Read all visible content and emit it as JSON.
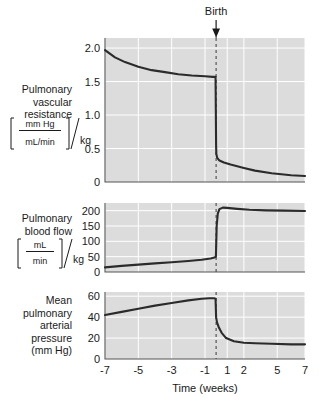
{
  "figure": {
    "annotation": "Birth",
    "xlabel": "Time (weeks)",
    "background_color": "#dcdcdc",
    "grid_color": "#ffffff",
    "curve_color": "#2b2b2b"
  },
  "panels": [
    {
      "id": "pulmonary-vascular-resistance",
      "label_lines": [
        "Pulmonary",
        "vascular",
        "resistance"
      ],
      "unit_numerator": "mm Hg",
      "unit_denominator": "mL/min",
      "unit_suffix": "/kg",
      "yticks": [
        "0",
        "0.5",
        "1.0",
        "1.5",
        "2.0"
      ]
    },
    {
      "id": "pulmonary-blood-flow",
      "label_lines": [
        "Pulmonary",
        "blood flow"
      ],
      "unit_numerator": "mL",
      "unit_denominator": "min",
      "unit_suffix": "/kg",
      "yticks": [
        "0",
        "50",
        "100",
        "150",
        "200"
      ]
    },
    {
      "id": "mean-pulmonary-arterial-pressure",
      "label_lines": [
        "Mean",
        "pulmonary",
        "arterial",
        "pressure",
        "(mm Hg)"
      ],
      "unit_numerator": "",
      "unit_denominator": "",
      "unit_suffix": "",
      "yticks": [
        "0",
        "20",
        "40",
        "60"
      ]
    }
  ],
  "xticks": [
    "-7",
    "-5",
    "-3",
    "-1",
    "1",
    "2",
    "5",
    "7"
  ],
  "chart_data": {
    "type": "line",
    "title": "",
    "xlabel": "Time (weeks)",
    "annotations": [
      {
        "text": "Birth",
        "x": 0
      }
    ],
    "x_tick_values": [
      -7,
      -5,
      -3,
      -1,
      1,
      2,
      5,
      7
    ],
    "x_tick_positions_frac": [
      0.0,
      0.1667,
      0.3333,
      0.5,
      0.6111,
      0.6944,
      0.8611,
      1.0
    ],
    "grid": true,
    "legend": "none",
    "charts": [
      {
        "id": "pulmonary-vascular-resistance",
        "ylabel": "Pulmonary vascular resistance [mm Hg / mL/min] / kg",
        "ylim": [
          0,
          2.15
        ],
        "yticks": [
          0,
          0.5,
          1.0,
          1.5,
          2.0
        ],
        "series": [
          {
            "name": "Pulmonary vascular resistance",
            "points": [
              [
                -7,
                1.97
              ],
              [
                -6.4,
                1.86
              ],
              [
                -5.8,
                1.79
              ],
              [
                -5.0,
                1.72
              ],
              [
                -4.2,
                1.67
              ],
              [
                -3.4,
                1.64
              ],
              [
                -2.6,
                1.61
              ],
              [
                -1.8,
                1.59
              ],
              [
                -1.0,
                1.58
              ],
              [
                -0.3,
                1.57
              ],
              [
                -0.05,
                1.57
              ],
              [
                0.0,
                0.55
              ],
              [
                0.02,
                0.42
              ],
              [
                0.1,
                0.36
              ],
              [
                0.3,
                0.32
              ],
              [
                0.7,
                0.29
              ],
              [
                1.2,
                0.26
              ],
              [
                2.0,
                0.21
              ],
              [
                3.0,
                0.17
              ],
              [
                4.5,
                0.13
              ],
              [
                6.0,
                0.1
              ],
              [
                7.0,
                0.09
              ]
            ]
          }
        ]
      },
      {
        "id": "pulmonary-blood-flow",
        "ylabel": "Pulmonary blood flow [mL / min] / kg",
        "ylim": [
          0,
          225
        ],
        "yticks": [
          0,
          50,
          100,
          150,
          200
        ],
        "series": [
          {
            "name": "Pulmonary blood flow",
            "points": [
              [
                -7,
                15
              ],
              [
                -6.0,
                20
              ],
              [
                -5.0,
                24
              ],
              [
                -4.0,
                28
              ],
              [
                -3.0,
                32
              ],
              [
                -2.0,
                36
              ],
              [
                -1.2,
                40
              ],
              [
                -0.5,
                44
              ],
              [
                -0.15,
                47
              ],
              [
                -0.02,
                50
              ],
              [
                0.05,
                150
              ],
              [
                0.15,
                190
              ],
              [
                0.3,
                205
              ],
              [
                0.6,
                210
              ],
              [
                1.0,
                209
              ],
              [
                1.6,
                206
              ],
              [
                2.5,
                203
              ],
              [
                4.0,
                201
              ],
              [
                5.5,
                200
              ],
              [
                7.0,
                199
              ]
            ]
          }
        ]
      },
      {
        "id": "mean-pulmonary-arterial-pressure",
        "ylabel": "Mean pulmonary arterial pressure (mm Hg)",
        "ylim": [
          0,
          64
        ],
        "yticks": [
          0,
          20,
          40,
          60
        ],
        "series": [
          {
            "name": "Mean pulmonary arterial pressure",
            "points": [
              [
                -7,
                42
              ],
              [
                -6.0,
                45
              ],
              [
                -5.0,
                48
              ],
              [
                -4.0,
                51
              ],
              [
                -3.0,
                53.5
              ],
              [
                -2.0,
                56
              ],
              [
                -1.2,
                57.5
              ],
              [
                -0.6,
                58
              ],
              [
                -0.2,
                58
              ],
              [
                -0.05,
                57.5
              ],
              [
                0.0,
                40
              ],
              [
                0.08,
                35
              ],
              [
                0.25,
                30
              ],
              [
                0.5,
                25
              ],
              [
                0.9,
                20
              ],
              [
                1.4,
                17
              ],
              [
                2.0,
                15.5
              ],
              [
                3.0,
                15
              ],
              [
                4.5,
                14.5
              ],
              [
                6.0,
                14
              ],
              [
                7.0,
                14
              ]
            ]
          }
        ]
      }
    ]
  }
}
